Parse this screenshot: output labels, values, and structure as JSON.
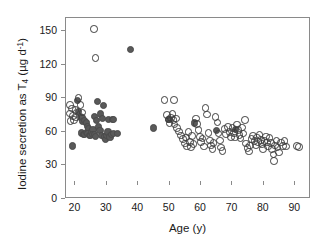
{
  "chart_data": {
    "type": "scatter",
    "title": "",
    "xlabel": "Age (y)",
    "ylabel_parts": {
      "pre": "Iodine secretion as T",
      "sub": "4",
      "mid": " (µg d",
      "sup": "-1",
      "post": ")"
    },
    "ylabel": "Iodine secretion as T4 (µg d-1)",
    "xlim": [
      17,
      95
    ],
    "ylim": [
      0,
      162
    ],
    "xticks": [
      20,
      30,
      40,
      50,
      60,
      70,
      80,
      90
    ],
    "yticks": [
      0,
      30,
      60,
      90,
      120,
      150
    ],
    "grid": false,
    "legend": "none",
    "colors": {
      "filled_marker": "#595959",
      "open_marker_edge": "#3d3d3d",
      "frame": "#8a8a8a",
      "text": "#1a1a1a"
    },
    "series": [
      {
        "name": "filled",
        "marker": "filled circle",
        "points": [
          [
            19.0,
            47.5
          ],
          [
            20.6,
            88.5
          ],
          [
            21.0,
            78.0
          ],
          [
            21.6,
            74.0
          ],
          [
            22.1,
            72.5
          ],
          [
            22.4,
            69.0
          ],
          [
            22.0,
            59.0
          ],
          [
            22.6,
            58.0
          ],
          [
            23.0,
            57.5
          ],
          [
            23.4,
            59.5
          ],
          [
            23.0,
            70.5
          ],
          [
            23.6,
            68.0
          ],
          [
            23.9,
            65.0
          ],
          [
            24.2,
            63.0
          ],
          [
            24.0,
            58.5
          ],
          [
            24.5,
            57.0
          ],
          [
            24.9,
            56.5
          ],
          [
            25.2,
            60.0
          ],
          [
            25.6,
            62.5
          ],
          [
            25.4,
            57.5
          ],
          [
            26.0,
            58.0
          ],
          [
            26.4,
            56.0
          ],
          [
            26.0,
            73.5
          ],
          [
            26.6,
            70.0
          ],
          [
            27.0,
            87.0
          ],
          [
            27.4,
            64.5
          ],
          [
            27.8,
            61.0
          ],
          [
            28.2,
            57.0
          ],
          [
            28.0,
            76.0
          ],
          [
            28.6,
            72.0
          ],
          [
            29.0,
            83.5
          ],
          [
            29.2,
            55.5
          ],
          [
            29.6,
            53.5
          ],
          [
            30.0,
            57.0
          ],
          [
            30.4,
            60.0
          ],
          [
            30.6,
            71.5
          ],
          [
            31.0,
            55.5
          ],
          [
            31.4,
            57.5
          ],
          [
            31.8,
            71.5
          ],
          [
            32.2,
            71.0
          ],
          [
            32.0,
            58.5
          ],
          [
            33.4,
            58.5
          ],
          [
            37.5,
            134.0
          ],
          [
            44.8,
            63.5
          ],
          [
            49.8,
            71.0
          ],
          [
            58.0,
            68.0
          ],
          [
            65.0,
            61.0
          ],
          [
            71.0,
            62.0
          ]
        ]
      },
      {
        "name": "open",
        "marker": "open circle",
        "points": [
          [
            18.2,
            84.0
          ],
          [
            18.3,
            76.5
          ],
          [
            18.4,
            70.0
          ],
          [
            19.0,
            81.0
          ],
          [
            19.3,
            74.5
          ],
          [
            19.6,
            70.5
          ],
          [
            20.0,
            79.5
          ],
          [
            20.2,
            73.0
          ],
          [
            21.0,
            90.5
          ],
          [
            21.6,
            84.0
          ],
          [
            22.2,
            77.5
          ],
          [
            25.9,
            152.0
          ],
          [
            26.4,
            126.0
          ],
          [
            48.3,
            88.5
          ],
          [
            51.4,
            88.5
          ],
          [
            49.2,
            75.0
          ],
          [
            49.6,
            71.0
          ],
          [
            50.0,
            67.5
          ],
          [
            50.4,
            72.5
          ],
          [
            50.9,
            76.0
          ],
          [
            51.2,
            70.5
          ],
          [
            51.6,
            66.5
          ],
          [
            52.0,
            72.0
          ],
          [
            52.4,
            63.5
          ],
          [
            53.0,
            60.5
          ],
          [
            53.6,
            57.0
          ],
          [
            54.2,
            53.5
          ],
          [
            54.8,
            49.5
          ],
          [
            55.2,
            55.0
          ],
          [
            55.6,
            47.0
          ],
          [
            56.0,
            60.0
          ],
          [
            56.4,
            51.0
          ],
          [
            56.8,
            46.5
          ],
          [
            57.2,
            56.5
          ],
          [
            57.6,
            49.0
          ],
          [
            58.4,
            72.0
          ],
          [
            58.8,
            67.0
          ],
          [
            59.2,
            61.5
          ],
          [
            59.6,
            55.5
          ],
          [
            60.0,
            51.0
          ],
          [
            60.5,
            54.0
          ],
          [
            61.0,
            47.0
          ],
          [
            61.4,
            81.5
          ],
          [
            61.8,
            75.5
          ],
          [
            62.4,
            59.0
          ],
          [
            62.8,
            52.5
          ],
          [
            63.2,
            48.0
          ],
          [
            63.6,
            44.5
          ],
          [
            64.0,
            50.0
          ],
          [
            64.6,
            73.5
          ],
          [
            65.2,
            68.5
          ],
          [
            65.6,
            58.5
          ],
          [
            66.0,
            52.5
          ],
          [
            66.4,
            46.0
          ],
          [
            66.8,
            43.0
          ],
          [
            67.5,
            62.5
          ],
          [
            68.0,
            58.0
          ],
          [
            68.5,
            64.5
          ],
          [
            69.0,
            60.0
          ],
          [
            69.5,
            55.5
          ],
          [
            70.0,
            63.5
          ],
          [
            70.4,
            59.0
          ],
          [
            70.8,
            55.0
          ],
          [
            71.4,
            66.5
          ],
          [
            71.8,
            62.0
          ],
          [
            72.2,
            57.5
          ],
          [
            72.6,
            54.0
          ],
          [
            73.0,
            64.0
          ],
          [
            73.5,
            58.5
          ],
          [
            74.0,
            70.5
          ],
          [
            74.4,
            49.5
          ],
          [
            74.8,
            45.5
          ],
          [
            75.2,
            42.5
          ],
          [
            75.6,
            48.0
          ],
          [
            76.0,
            53.5
          ],
          [
            76.5,
            56.5
          ],
          [
            77.0,
            52.0
          ],
          [
            77.4,
            48.5
          ],
          [
            77.8,
            55.0
          ],
          [
            78.2,
            51.0
          ],
          [
            78.6,
            57.5
          ],
          [
            79.0,
            53.0
          ],
          [
            79.4,
            49.0
          ],
          [
            79.8,
            45.0
          ],
          [
            80.2,
            52.0
          ],
          [
            80.6,
            56.0
          ],
          [
            81.0,
            50.5
          ],
          [
            81.4,
            47.0
          ],
          [
            81.8,
            54.5
          ],
          [
            82.2,
            50.0
          ],
          [
            82.6,
            44.5
          ],
          [
            83.0,
            40.0
          ],
          [
            83.2,
            34.0
          ],
          [
            83.6,
            48.0
          ],
          [
            84.0,
            52.5
          ],
          [
            84.4,
            46.0
          ],
          [
            84.8,
            41.5
          ],
          [
            85.4,
            50.5
          ],
          [
            86.0,
            47.5
          ],
          [
            86.6,
            52.0
          ],
          [
            87.0,
            47.0
          ],
          [
            90.5,
            47.5
          ],
          [
            91.2,
            46.5
          ]
        ]
      }
    ]
  }
}
